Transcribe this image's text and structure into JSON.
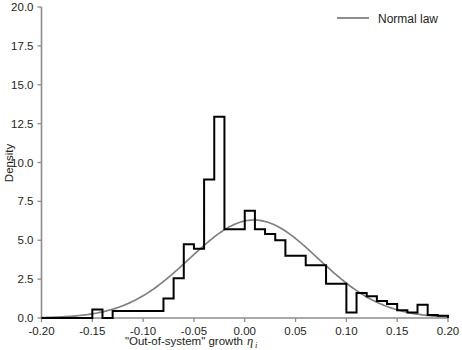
{
  "chart_data": {
    "type": "bar",
    "title": "",
    "subtitle": "",
    "xlabel": "\"Out-of-system\" growth",
    "xlabel_symbol": "η",
    "xlabel_subscript": "i",
    "ylabel": "Density",
    "xlim": [
      -0.2,
      0.2
    ],
    "ylim": [
      0.0,
      20.0
    ],
    "grid": false,
    "x_ticks": [
      -0.2,
      -0.15,
      -0.1,
      -0.05,
      0.0,
      0.05,
      0.1,
      0.15,
      0.2
    ],
    "x_tick_labels": [
      "-0.20",
      "-0.15",
      "-0.10",
      "-0.05",
      "0.00",
      "0.05",
      "0.10",
      "0.15",
      "0.20"
    ],
    "y_ticks": [
      0.0,
      2.5,
      5.0,
      7.5,
      10.0,
      12.5,
      15.0,
      17.5,
      20.0
    ],
    "y_tick_labels": [
      "0.0",
      "2.5",
      "5.0",
      "7.5",
      "10.0",
      "12.5",
      "15.0",
      "17.5",
      "20.0"
    ],
    "bin_width": 0.01,
    "bin_edges": [
      -0.2,
      -0.19,
      -0.18,
      -0.17,
      -0.16,
      -0.15,
      -0.14,
      -0.13,
      -0.12,
      -0.11,
      -0.1,
      -0.09,
      -0.08,
      -0.07,
      -0.06,
      -0.05,
      -0.04,
      -0.03,
      -0.02,
      -0.01,
      0.0,
      0.01,
      0.02,
      0.03,
      0.04,
      0.05,
      0.06,
      0.07,
      0.08,
      0.09,
      0.1,
      0.11,
      0.12,
      0.13,
      0.14,
      0.15,
      0.16,
      0.17,
      0.18,
      0.19,
      0.2
    ],
    "categories": [
      "-0.195",
      "-0.185",
      "-0.175",
      "-0.165",
      "-0.155",
      "-0.145",
      "-0.135",
      "-0.125",
      "-0.115",
      "-0.105",
      "-0.095",
      "-0.085",
      "-0.075",
      "-0.065",
      "-0.055",
      "-0.045",
      "-0.035",
      "-0.025",
      "-0.015",
      "-0.005",
      "0.005",
      "0.015",
      "0.025",
      "0.035",
      "0.045",
      "0.055",
      "0.065",
      "0.075",
      "0.085",
      "0.095",
      "0.105",
      "0.115",
      "0.125",
      "0.135",
      "0.145",
      "0.155",
      "0.165",
      "0.175",
      "0.185",
      "0.195"
    ],
    "values": [
      0.0,
      0.0,
      0.0,
      0.0,
      0.0,
      0.55,
      0.0,
      0.45,
      0.45,
      0.45,
      0.45,
      0.45,
      1.25,
      2.55,
      4.75,
      4.45,
      8.9,
      12.95,
      5.7,
      5.7,
      6.9,
      5.7,
      5.4,
      5.0,
      4.0,
      4.0,
      3.4,
      3.4,
      2.2,
      2.2,
      0.35,
      1.6,
      1.4,
      1.1,
      0.9,
      0.5,
      0.35,
      0.85,
      0.2,
      0.15
    ],
    "series": [
      {
        "name": "Histogram",
        "type": "bar",
        "color": "#000000",
        "values": [
          0.0,
          0.0,
          0.0,
          0.0,
          0.0,
          0.55,
          0.0,
          0.45,
          0.45,
          0.45,
          0.45,
          0.45,
          1.25,
          2.55,
          4.75,
          4.45,
          8.9,
          12.95,
          5.7,
          5.7,
          6.9,
          5.7,
          5.4,
          5.0,
          4.0,
          4.0,
          3.4,
          3.4,
          2.2,
          2.2,
          0.35,
          1.6,
          1.4,
          1.1,
          0.9,
          0.5,
          0.35,
          0.85,
          0.2,
          0.15
        ]
      },
      {
        "name": "Normal law",
        "type": "line",
        "color": "#808080",
        "mean": 0.009,
        "sigma": 0.0633,
        "peak_density": 6.3
      }
    ],
    "legend": {
      "position": "top-right",
      "entries": [
        {
          "label": "Normal law",
          "color": "#808080",
          "marker": "line"
        }
      ]
    },
    "annotations": []
  },
  "axes": {
    "y_axis_label": "Density",
    "x_axis_label_prefix": "\"Out-of-system\" growth",
    "x_axis_label_symbol": "η",
    "x_axis_label_subscript": "i"
  },
  "legend": {
    "normal_law_label": "Normal law"
  },
  "colors": {
    "histogram": "#000000",
    "normal_curve": "#808080",
    "axis": "#7f7f7f",
    "text": "#231f20",
    "background": "#ffffff"
  }
}
